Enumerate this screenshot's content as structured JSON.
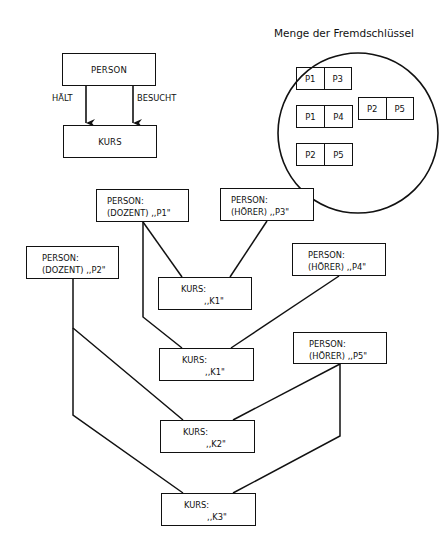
{
  "schema": {
    "person_label": "PERSON",
    "kurs_label": "KURS",
    "relations": [
      {
        "label": "HÄLT"
      },
      {
        "label": "BESUCHT"
      }
    ]
  },
  "key_set": {
    "title": "Menge der Fremdschlüssel",
    "pairs": [
      {
        "a": "P1",
        "b": "P3"
      },
      {
        "a": "P1",
        "b": "P4"
      },
      {
        "a": "P2",
        "b": "P5"
      },
      {
        "a": "P2",
        "b": "P5"
      }
    ]
  },
  "instances": {
    "persons": [
      {
        "type": "PERSON:",
        "detail": "(DOZENT) ,,P1\""
      },
      {
        "type": "PERSON:",
        "detail": "(HÖRER) ,,P3\""
      },
      {
        "type": "PERSON:",
        "detail": "(DOZENT) ,,P2\""
      },
      {
        "type": "PERSON:",
        "detail": "(HÖRER) ,,P4\""
      },
      {
        "type": "PERSON:",
        "detail": "(HÖRER) ,,P5\""
      }
    ],
    "kurse": [
      {
        "type": "KURS:",
        "detail": ",,K1\""
      },
      {
        "type": "KURS:",
        "detail": ",,K1\""
      },
      {
        "type": "KURS:",
        "detail": ",,K2\""
      },
      {
        "type": "KURS:",
        "detail": ",,K3\""
      }
    ]
  }
}
